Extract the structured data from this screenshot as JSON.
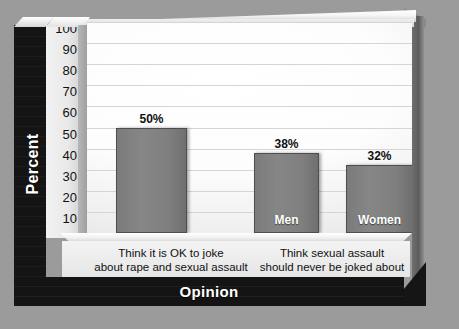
{
  "chart_data": {
    "type": "bar",
    "title": "",
    "xlabel": "Opinion",
    "ylabel": "Percent",
    "ylim": [
      0,
      100
    ],
    "ytick_labels": [
      "100",
      "90",
      "80",
      "70",
      "60",
      "50",
      "40",
      "30",
      "20",
      "10",
      "0"
    ],
    "ytick_values": [
      100,
      90,
      80,
      70,
      60,
      50,
      40,
      30,
      20,
      10,
      0
    ],
    "grid": true,
    "legend": "none",
    "categories": [
      "Think it is OK to joke about rape and sexual assault",
      "Think sexual assault should never be joked about"
    ],
    "bars": [
      {
        "group": "Think it is OK to joke about rape and sexual assault",
        "series": "",
        "inside_label": "",
        "value": 50,
        "value_label": "50%"
      },
      {
        "group": "Think sexual assault should never be joked about",
        "series": "Men",
        "inside_label": "Men",
        "value": 38,
        "value_label": "38%"
      },
      {
        "group": "Think sexual assault should never be joked about",
        "series": "Women",
        "inside_label": "Women",
        "value": 32,
        "value_label": "32%"
      }
    ]
  },
  "axes": {
    "y_title": "Percent",
    "x_title": "Opinion",
    "ticks": [
      "100",
      "90",
      "80",
      "70",
      "60",
      "50",
      "40",
      "30",
      "20",
      "10",
      "0"
    ]
  },
  "categories": [
    {
      "line1": "Think it is OK to joke",
      "line2": "about rape and sexual assault"
    },
    {
      "line1": "Think sexual assault",
      "line2": "should never be joked about"
    }
  ],
  "bars": [
    {
      "value_label": "50%",
      "inside_label": ""
    },
    {
      "value_label": "38%",
      "inside_label": "Men"
    },
    {
      "value_label": "32%",
      "inside_label": "Women"
    }
  ],
  "colors": {
    "background": "#9b9b9b",
    "bar_fill": "#7f7f7f",
    "bar_border": "#4e4e4e",
    "band_dark": "#171717",
    "plot_light": "#ffffff",
    "gridline": "#d5d5d5",
    "band_text": "#ffffff"
  }
}
